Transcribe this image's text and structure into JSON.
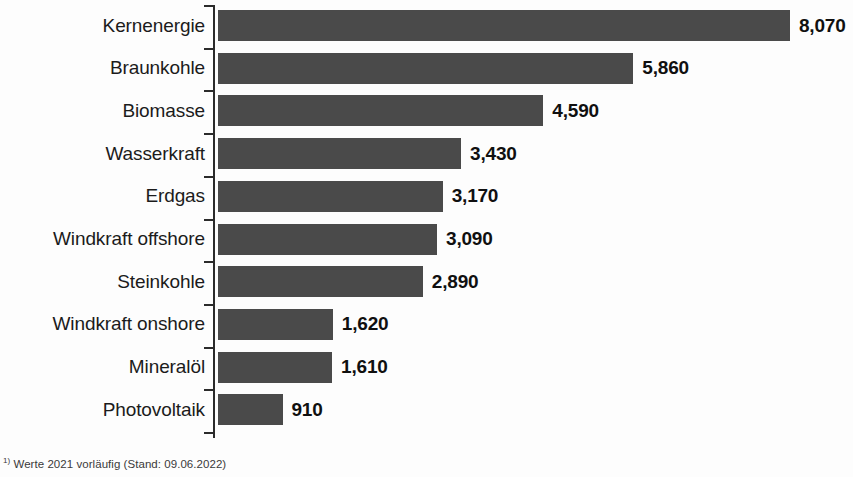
{
  "chart_data": {
    "type": "bar",
    "orientation": "horizontal",
    "title": "",
    "subtitle": "",
    "xlabel": "",
    "ylabel": "",
    "categories": [
      "Kernenergie",
      "Braunkohle",
      "Biomasse",
      "Wasserkraft",
      "Erdgas",
      "Windkraft offshore",
      "Steinkohle",
      "Windkraft onshore",
      "Mineralöl",
      "Photovoltaik"
    ],
    "values": [
      8070,
      5860,
      4590,
      3430,
      3170,
      3090,
      2890,
      1620,
      1610,
      910
    ],
    "value_labels": [
      "8,070",
      "5,860",
      "4,590",
      "3,430",
      "3,170",
      "3,090",
      "2,890",
      "1,620",
      "1,610",
      "910"
    ],
    "xlim": [
      0,
      8070
    ],
    "grid": false,
    "legend": null,
    "bar_color": "#4a4a4a",
    "text_color": "#101010",
    "axis_color": "#2b2b2b",
    "background_color": "#fdfdfd"
  },
  "footnote": {
    "marker": "1)",
    "text": "Werte 2021 vorläufig (Stand: 09.06.2022)"
  }
}
